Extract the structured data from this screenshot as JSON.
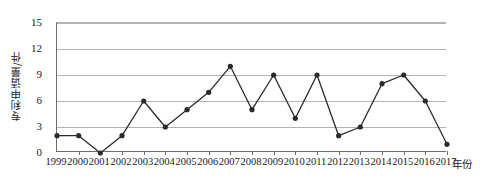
{
  "chart_data": {
    "type": "line",
    "title": "",
    "subtitle": "",
    "xlabel": "年份",
    "ylabel": "专利申请量/件",
    "categories": [
      "1999",
      "2000",
      "2001",
      "2002",
      "2003",
      "2004",
      "2005",
      "2006",
      "2007",
      "2008",
      "2009",
      "2010",
      "2011",
      "2012",
      "2013",
      "2014",
      "2015",
      "2016",
      "2017"
    ],
    "values": [
      2,
      2,
      0,
      2,
      6,
      3,
      5,
      7,
      10,
      5,
      9,
      4,
      9,
      2,
      3,
      8,
      9,
      6,
      1
    ],
    "series": [
      {
        "name": "专利申请量",
        "values": [
          2,
          2,
          0,
          2,
          6,
          3,
          5,
          7,
          10,
          5,
          9,
          4,
          9,
          2,
          3,
          8,
          9,
          6,
          1
        ]
      }
    ],
    "x_tick_labels": [
      "1999",
      "2000",
      "2001",
      "2002",
      "2003",
      "2004",
      "2005",
      "2006",
      "2007",
      "2008",
      "2009",
      "2010",
      "2011",
      "2012",
      "2013",
      "2014",
      "2015",
      "2016",
      "2017"
    ],
    "y_tick_labels": [
      "0",
      "3",
      "6",
      "9",
      "12",
      "15"
    ],
    "y_ticks": [
      0,
      3,
      6,
      9,
      12,
      15
    ],
    "ylim": [
      0,
      15
    ],
    "xlim": [
      1999,
      2017
    ],
    "grid": true,
    "grid_axis": "y",
    "legend": false,
    "legend_position": "none",
    "marker": "circle",
    "annotations": [],
    "colors": {
      "line": "#2b2b2b",
      "marker": "#2b2b2b",
      "grid": "#b3b3b3",
      "axis": "#6d6d6d",
      "text": "#1a1a1a",
      "background": "#ffffff"
    }
  }
}
